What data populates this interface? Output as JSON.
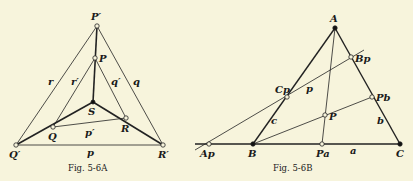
{
  "figures": [
    {
      "id": "fig-5-6a",
      "caption": "Fig. 5-6A",
      "points": {
        "P_prime": {
          "label": "P′",
          "x": 97,
          "y": 26,
          "style": "open"
        },
        "P": {
          "label": "P",
          "x": 95,
          "y": 58,
          "style": "open"
        },
        "S": {
          "label": "S",
          "x": 93,
          "y": 102,
          "style": "filled"
        },
        "Q": {
          "label": "Q",
          "x": 53,
          "y": 127,
          "style": "open"
        },
        "R": {
          "label": "R",
          "x": 126,
          "y": 118,
          "style": "open"
        },
        "Q_prime": {
          "label": "Q′",
          "x": 16,
          "y": 145,
          "style": "open"
        },
        "R_prime": {
          "label": "R′",
          "x": 163,
          "y": 145,
          "style": "open"
        }
      },
      "line_labels": {
        "r": "r",
        "r_prime": "r′",
        "q_prime": "q′",
        "q": "q",
        "p_prime": "p′",
        "p": "p"
      }
    },
    {
      "id": "fig-5-6b",
      "caption": "Fig. 5-6B",
      "points": {
        "A": {
          "label": "A",
          "x": 335,
          "y": 28,
          "style": "filled"
        },
        "B_p": {
          "label": "Bp",
          "x": 351,
          "y": 57,
          "style": "open"
        },
        "C_p": {
          "label": "Cp",
          "x": 287,
          "y": 97,
          "style": "open"
        },
        "P_b": {
          "label": "Pb",
          "x": 372,
          "y": 97,
          "style": "open"
        },
        "P": {
          "label": "P",
          "x": 325,
          "y": 115,
          "style": "open"
        },
        "A_p": {
          "label": "Ap",
          "x": 209,
          "y": 144,
          "style": "open"
        },
        "B": {
          "label": "B",
          "x": 253,
          "y": 144,
          "style": "filled"
        },
        "P_a": {
          "label": "Pa",
          "x": 322,
          "y": 144,
          "style": "open"
        },
        "C": {
          "label": "C",
          "x": 400,
          "y": 144,
          "style": "filled"
        }
      },
      "line_labels": {
        "p": "p",
        "c": "c",
        "b": "b",
        "a": "a"
      }
    }
  ]
}
